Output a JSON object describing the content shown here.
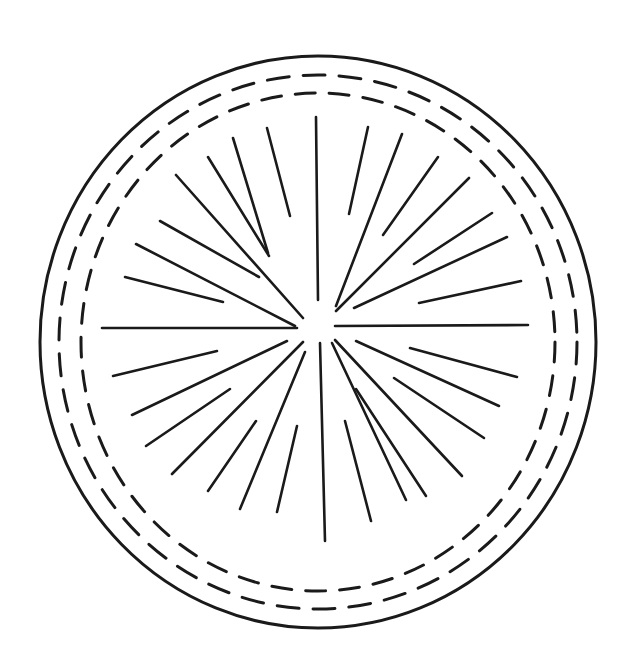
{
  "canvas": {
    "width": 629,
    "height": 664,
    "background": "#ffffff",
    "stroke": "#1a1a1a"
  },
  "outer_circle": {
    "cx": 318,
    "cy": 342,
    "rx": 278,
    "ry": 286,
    "width": 3
  },
  "dashed_rings": [
    {
      "cx": 318,
      "cy": 342,
      "rx": 259,
      "ry": 267,
      "width": 3,
      "dash": "22 14"
    },
    {
      "cx": 318,
      "cy": 342,
      "rx": 237,
      "ry": 249,
      "width": 3,
      "dash": "20 14"
    }
  ],
  "rays": [
    [
      316,
      117,
      318,
      300
    ],
    [
      267,
      128,
      290,
      216
    ],
    [
      233,
      138,
      268,
      253
    ],
    [
      208,
      157,
      269,
      256
    ],
    [
      176,
      175,
      303,
      318
    ],
    [
      160,
      221,
      259,
      277
    ],
    [
      136,
      244,
      295,
      326
    ],
    [
      125,
      277,
      223,
      302
    ],
    [
      102,
      328,
      297,
      328
    ],
    [
      368,
      127,
      349,
      214
    ],
    [
      402,
      134,
      336,
      306
    ],
    [
      438,
      157,
      383,
      235
    ],
    [
      469,
      178,
      336,
      311
    ],
    [
      492,
      213,
      414,
      264
    ],
    [
      507,
      237,
      354,
      308
    ],
    [
      521,
      281,
      419,
      303
    ],
    [
      335,
      326,
      528,
      325
    ],
    [
      217,
      351,
      113,
      376
    ],
    [
      287,
      341,
      132,
      415
    ],
    [
      230,
      389,
      146,
      446
    ],
    [
      303,
      342,
      172,
      474
    ],
    [
      256,
      421,
      208,
      491
    ],
    [
      305,
      352,
      240,
      509
    ],
    [
      297,
      426,
      277,
      512
    ],
    [
      320,
      343,
      325,
      541
    ],
    [
      332,
      343,
      406,
      500
    ],
    [
      345,
      421,
      371,
      521
    ],
    [
      356,
      389,
      426,
      496
    ],
    [
      335,
      340,
      462,
      476
    ],
    [
      394,
      378,
      484,
      438
    ],
    [
      356,
      341,
      499,
      406
    ],
    [
      410,
      348,
      517,
      377
    ]
  ]
}
